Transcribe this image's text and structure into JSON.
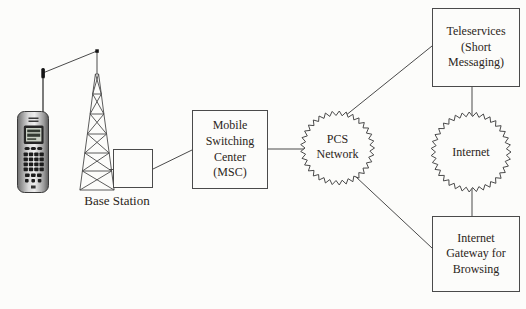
{
  "diagram": {
    "labels": {
      "base_station": "Base Station",
      "msc": "Mobile Switching Center (MSC)",
      "pcs_network": "PCS Network",
      "internet": "Internet",
      "teleservices": "Teleservices (Short Messaging)",
      "internet_gateway": "Internet Gateway for Browsing"
    },
    "colors": {
      "line": "#4a4a4a",
      "text": "#2b2520",
      "background": "#fcfcfa"
    },
    "connections": [
      {
        "from": "mobile-phone",
        "to": "base-station-tower",
        "type": "wireless"
      },
      {
        "from": "base-station-tower",
        "to": "base-station-box",
        "type": "line"
      },
      {
        "from": "base-station-box",
        "to": "msc",
        "type": "line"
      },
      {
        "from": "msc",
        "to": "pcs-network",
        "type": "line"
      },
      {
        "from": "pcs-network",
        "to": "teleservices",
        "type": "line"
      },
      {
        "from": "pcs-network",
        "to": "internet-gateway",
        "type": "line"
      },
      {
        "from": "teleservices",
        "to": "internet",
        "type": "line"
      },
      {
        "from": "internet",
        "to": "internet-gateway",
        "type": "line"
      }
    ]
  }
}
